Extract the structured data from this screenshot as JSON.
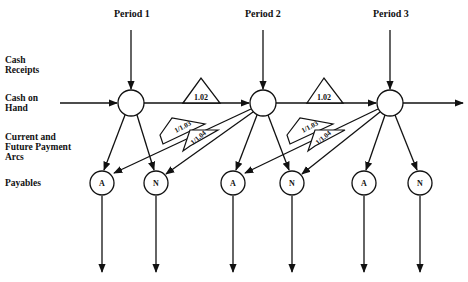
{
  "periods": [
    "Period 1",
    "Period 2",
    "Period 3"
  ],
  "row_labels": {
    "cash_receipts": "Cash\nReceipts",
    "cash_on_hand": "Cash on\nHand",
    "payment_arcs": "Current and\nFuture Payment\nArcs",
    "payables": "Payables"
  },
  "arc_multipliers": {
    "cash_carry": "1.02",
    "pay_A": "1/1.03",
    "pay_N": "1/1.04"
  },
  "payable_nodes": [
    "A",
    "N",
    "A",
    "N",
    "A",
    "N"
  ],
  "colors": {
    "line": "#111111",
    "background": "#ffffff"
  }
}
